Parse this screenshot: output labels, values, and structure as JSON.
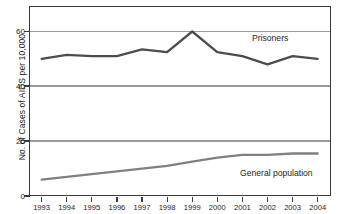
{
  "chart_data": {
    "type": "line",
    "title": "",
    "xlabel": "",
    "ylabel": "No. of Cases of AIDS per 10,000",
    "categories": [
      "1993",
      "1994",
      "1995",
      "1996",
      "1997",
      "1998",
      "1999",
      "2000",
      "2001",
      "2002",
      "2003",
      "2004"
    ],
    "x": [
      1993,
      1994,
      1995,
      1996,
      1997,
      1998,
      1999,
      2000,
      2001,
      2002,
      2003,
      2004
    ],
    "ylim": [
      0,
      70
    ],
    "yticks": [
      0,
      20,
      40,
      60
    ],
    "ytick_labels": [
      "0",
      "20",
      "40",
      "60"
    ],
    "grid": "horizontal",
    "legend_position": "inline-annotation",
    "series": [
      {
        "name": "Prisoners",
        "color": "#4d4d4d",
        "values": [
          50.0,
          51.5,
          51.0,
          51.0,
          53.5,
          52.5,
          60.0,
          52.5,
          51.0,
          48.0,
          51.0,
          50.0
        ]
      },
      {
        "name": "General population",
        "color": "#808080",
        "values": [
          6.0,
          7.0,
          8.0,
          9.0,
          10.0,
          11.0,
          12.5,
          14.0,
          15.0,
          15.0,
          15.5,
          15.5
        ]
      }
    ],
    "annotations": [
      {
        "text": "Prisoners",
        "series": "Prisoners"
      },
      {
        "text": "General population",
        "series": "General population"
      }
    ]
  },
  "colors": {
    "frame": "#3a3a3a",
    "gridline": "#9a9a9a",
    "prisoners_line": "#4d4d4d",
    "general_line": "#808080",
    "text": "#1d1d1d",
    "background": "#ffffff"
  }
}
